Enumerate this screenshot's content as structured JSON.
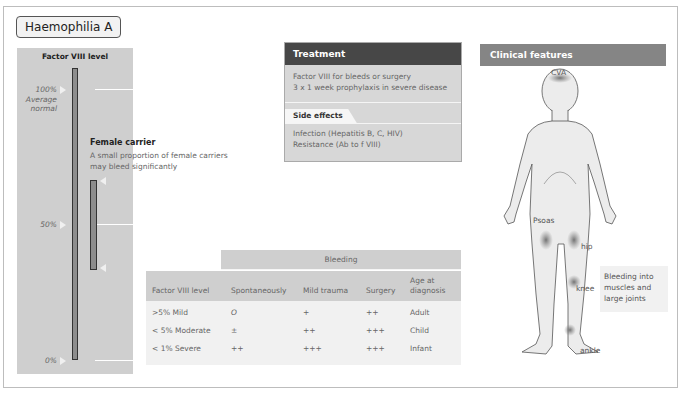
{
  "title": "Haemophilia A",
  "factor_panel": {
    "title": "Factor VIII level",
    "ticks": [
      {
        "label": "100%",
        "sublabel": "Average\nnormal",
        "value": 100
      },
      {
        "label": "50%",
        "value": 50
      },
      {
        "label": "0%",
        "value": 0
      }
    ],
    "tick_100": "100%",
    "tick_100_sub1": "Average",
    "tick_100_sub2": "normal",
    "tick_50": "50%",
    "tick_0": "0%",
    "carrier": {
      "heading": "Female carrier",
      "line1": "A small proportion of female carriers",
      "line2": "may bleed significantly"
    }
  },
  "treatment": {
    "heading": "Treatment",
    "items": [
      "Factor VIII for bleeds or surgery",
      "3 x 1 week prophylaxis in severe disease"
    ],
    "side_effects_label": "Side effects",
    "side_effects": [
      "Infection (Hepatitis B, C, HIV)",
      "Resistance (Ab to f VIII)"
    ]
  },
  "bleeding_table": {
    "group_header": "Bleeding",
    "columns": [
      "Factor VIII level",
      "Spontaneously",
      "Mild trauma",
      "Surgery",
      "Age at",
      "diagnosis"
    ],
    "rows": [
      [
        ">5% Mild",
        "O",
        "+",
        "++",
        "Adult"
      ],
      [
        "< 5% Moderate",
        "±",
        "++",
        "+++",
        "Child"
      ],
      [
        "< 1% Severe",
        "++",
        "+++",
        "+++",
        "Infant"
      ]
    ]
  },
  "clinical": {
    "heading": "Clinical features",
    "labels": {
      "cva": "CVA",
      "psoas": "Psoas",
      "hip": "hip",
      "knee": "knee",
      "ankle": "ankle"
    },
    "note": [
      "Bleeding into",
      "muscles and",
      "large joints"
    ]
  },
  "colors": {
    "panel_gray": "#cfcfcf",
    "treatment_head": "#474747",
    "clinical_head": "#858585",
    "bar_fill": "#8d8d8d",
    "bleed_spot": "#7a7a7a"
  }
}
